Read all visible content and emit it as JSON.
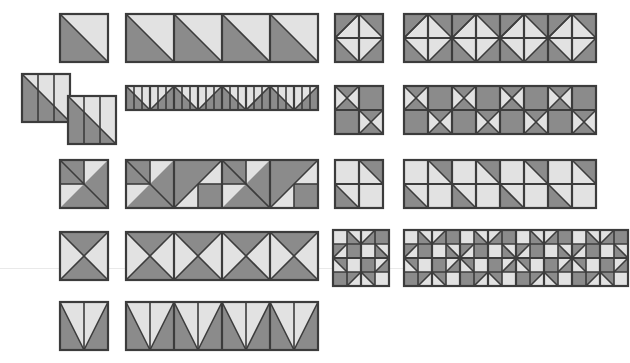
{
  "figure": {
    "type": "geometric-patch-diagram",
    "background_color": "#ffffff",
    "canvas": {
      "width": 615,
      "height": 363
    }
  },
  "palette": {
    "dark": "#8b8b8b",
    "light": "#e2e2e2",
    "outline": "#3c3c3c",
    "faint_rule": "#e9e9e9",
    "white": "#ffffff"
  },
  "geometry": {
    "cell": 48,
    "outline_width": 2.2,
    "inner_line_width": 1.6
  },
  "guides": [
    {
      "name": "horizontal-rule",
      "y": 268
    }
  ],
  "rows": [
    {
      "id": "row-1",
      "unit_name": "half-square-triangle",
      "unit_description": "Square split on the top-left to bottom-right diagonal; lower-left triangle dark, upper-right triangle light.",
      "single": {
        "x": 60,
        "y": 14,
        "size": 48
      },
      "strip": {
        "x": 126,
        "y": 14,
        "count": 4,
        "cell": 48,
        "mirror_alternate": false
      },
      "block": {
        "x": 335,
        "y": 14,
        "grid": 2,
        "cell": 24,
        "name": "diamond-in-square-block"
      },
      "block_strip": {
        "x": 404,
        "y": 14,
        "count": 4,
        "grid": 2,
        "cell": 24
      }
    },
    {
      "id": "row-2",
      "unit_name": "split-thirds-diagonal",
      "unit_description": "Square divided into three vertical strips crossed by a top-left to bottom-right diagonal.",
      "offset_pair": [
        {
          "x": 22,
          "y": 74,
          "size": 48
        },
        {
          "x": 68,
          "y": 96,
          "size": 48
        }
      ],
      "strip": {
        "x": 126,
        "y": 86,
        "count": 8,
        "cell": 24,
        "mirror_alternate": true
      },
      "block": {
        "x": 335,
        "y": 86,
        "grid": 2,
        "cell": 24,
        "name": "x-and-solid-checker-block"
      },
      "block_strip": {
        "x": 404,
        "y": 86,
        "count": 4,
        "grid": 2,
        "cell": 24
      }
    },
    {
      "id": "row-3",
      "unit_name": "corner-square-triangle",
      "unit_description": "Main diagonal with dark lower-right field, dark quarter square upper-left and a light triangle lower-left.",
      "single": {
        "x": 60,
        "y": 160,
        "size": 48
      },
      "strip": {
        "x": 126,
        "y": 160,
        "count": 4,
        "cell": 48,
        "mirror_alternate": true
      },
      "block": {
        "x": 335,
        "y": 160,
        "grid": 2,
        "cell": 24,
        "name": "two-triangle-two-plain-block"
      },
      "block_strip": {
        "x": 404,
        "y": 160,
        "count": 4,
        "grid": 2,
        "cell": 24
      }
    },
    {
      "id": "row-4",
      "unit_name": "hourglass-x",
      "unit_description": "Square crossed by both diagonals; top and bottom triangles dark, left and right triangles light.",
      "single": {
        "x": 60,
        "y": 232,
        "size": 48
      },
      "strip": {
        "x": 126,
        "y": 232,
        "count": 4,
        "cell": 48,
        "mirror_alternate": false
      },
      "block": {
        "x": 333,
        "y": 230,
        "grid": 4,
        "cell": 14,
        "name": "pinwheel-star-block"
      },
      "block_strip": {
        "x": 404,
        "y": 230,
        "count": 4,
        "grid": 4,
        "cell": 14
      }
    },
    {
      "id": "row-5",
      "unit_name": "v-notch",
      "unit_description": "Dark square containing a light V formed by two triangles meeting at the bottom centre.",
      "single": {
        "x": 60,
        "y": 302,
        "size": 48
      },
      "strip": {
        "x": 126,
        "y": 302,
        "count": 4,
        "cell": 48,
        "mirror_alternate": false
      },
      "block": null,
      "block_strip": null
    }
  ],
  "counts": {
    "rows": 5,
    "single_units": 6,
    "strips": 5,
    "blocks": 4,
    "block_strips": 4
  }
}
